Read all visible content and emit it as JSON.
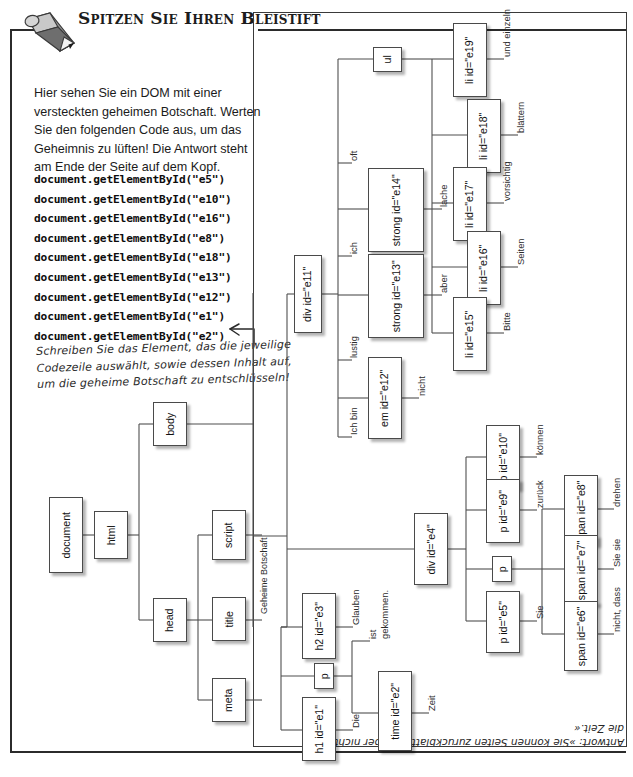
{
  "exercise": {
    "title": "Spitzen Sie Ihren Bleistift",
    "icon": "pencil-icon",
    "intro": "Hier sehen Sie ein DOM mit einer versteckten geheimen Botschaft. Werten Sie den folgenden Code aus, um das Geheimnis zu lüften! Die Antwort steht am Ende der Seite auf dem Kopf.",
    "code_lines": [
      "document.getElementById(\"e5\")",
      "document.getElementById(\"e10\")",
      "document.getElementById(\"e16\")",
      "document.getElementById(\"e8\")",
      "document.getElementById(\"e18\")",
      "document.getElementById(\"e13\")",
      "document.getElementById(\"e12\")",
      "document.getElementById(\"e1\")",
      "document.getElementById(\"e2\")"
    ],
    "handwritten_note": "Schreiben Sie das Element, das die jeweilige Codezeile auswählt, sowie dessen Inhalt auf, um die geheime Botschaft zu entschlüsseln!",
    "answer_upside_down": "Antwort: »Sie können Seiten zurückblättern, aber nicht die Zeit.«"
  },
  "tree": {
    "orientation": "rotated-90",
    "nodes": [
      {
        "id": "document",
        "label": "document"
      },
      {
        "id": "html",
        "label": "html"
      },
      {
        "id": "head",
        "label": "head"
      },
      {
        "id": "body",
        "label": "body"
      },
      {
        "id": "script",
        "label": "script"
      },
      {
        "id": "title",
        "label": "title"
      },
      {
        "id": "meta",
        "label": "meta"
      },
      {
        "id": "h1e1",
        "label": "h1 id=\"e1\""
      },
      {
        "id": "pA",
        "label": "p"
      },
      {
        "id": "timee2",
        "label": "time id=\"e2\""
      },
      {
        "id": "h2e3",
        "label": "h2 id=\"e3\""
      },
      {
        "id": "dive4",
        "label": "div id=\"e4\""
      },
      {
        "id": "pe5",
        "label": "p id=\"e5\""
      },
      {
        "id": "pB",
        "label": "p"
      },
      {
        "id": "spane6",
        "label": "span id=\"e6\""
      },
      {
        "id": "spane7",
        "label": "span id=\"e7\""
      },
      {
        "id": "spane8",
        "label": "span id=\"e8\""
      },
      {
        "id": "pe9",
        "label": "p id=\"e9\""
      },
      {
        "id": "pe10",
        "label": "p id=\"e10\""
      },
      {
        "id": "dive11",
        "label": "div id=\"e11\""
      },
      {
        "id": "eme12",
        "label": "em id=\"e12\""
      },
      {
        "id": "stronge13",
        "label": "strong id=\"e13\""
      },
      {
        "id": "stronge14",
        "label": "strong id=\"e14\""
      },
      {
        "id": "ul",
        "label": "ul"
      },
      {
        "id": "lie15",
        "label": "li id=\"e15\""
      },
      {
        "id": "lie16",
        "label": "li id=\"e16\""
      },
      {
        "id": "lie17",
        "label": "li id=\"e17\""
      },
      {
        "id": "lie18",
        "label": "li id=\"e18\""
      },
      {
        "id": "lie19",
        "label": "li id=\"e19\""
      }
    ],
    "text_nodes": [
      {
        "id": "t_title",
        "text": "Geheime Botschaft"
      },
      {
        "id": "t_h1",
        "text": "Die"
      },
      {
        "id": "t_time",
        "text": "Zeit"
      },
      {
        "id": "t_p_ist",
        "text": "ist"
      },
      {
        "id": "t_p_gek",
        "text": "gekommen."
      },
      {
        "id": "t_h2",
        "text": "Glauben"
      },
      {
        "id": "t_e5",
        "text": "Sie"
      },
      {
        "id": "t_e6",
        "text": "nicht, dass"
      },
      {
        "id": "t_e7",
        "text": "Sie sie"
      },
      {
        "id": "t_e8",
        "text": "zurück"
      },
      {
        "id": "t_e9",
        "text": "drehen"
      },
      {
        "id": "t_e10",
        "text": "können"
      },
      {
        "id": "t_ichbin",
        "text": "Ich bin"
      },
      {
        "id": "t_e12",
        "text": "nicht"
      },
      {
        "id": "t_lustig",
        "text": "lustig"
      },
      {
        "id": "t_e13",
        "text": "aber"
      },
      {
        "id": "t_ich",
        "text": "ich"
      },
      {
        "id": "t_e14",
        "text": "lache"
      },
      {
        "id": "t_oft",
        "text": "oft"
      },
      {
        "id": "t_e15",
        "text": "Bitte"
      },
      {
        "id": "t_e16",
        "text": "Seiten"
      },
      {
        "id": "t_e17",
        "text": "vorsichtig"
      },
      {
        "id": "t_e18",
        "text": "blättern"
      },
      {
        "id": "t_e19",
        "text": "und einzeln"
      }
    ]
  }
}
